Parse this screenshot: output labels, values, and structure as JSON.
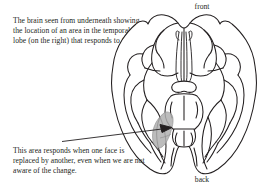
{
  "figure": {
    "type": "anatomical-diagram",
    "background_color": "#ffffff",
    "line_color": "#231f20",
    "highlight_color": "#b3b3b3"
  },
  "captions": {
    "top": "The brain seen from underneath showing the location of an area in the temporal lobe (on the right) that responds to faces.",
    "bottom": "This area responds when one face is replaced by another, even when we are not aware of the change."
  },
  "orientation_labels": {
    "front": "front",
    "back": "back"
  },
  "annotation": {
    "arrow_points_to": "shaded temporal lobe region",
    "arrow_start": {
      "x": 62,
      "y": 141
    },
    "arrow_end": {
      "x": 172,
      "y": 128
    }
  }
}
